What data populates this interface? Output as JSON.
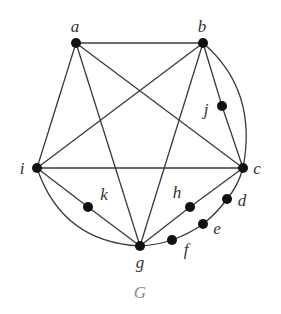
{
  "caption": "G",
  "colors": {
    "edge": "#3a3a3a",
    "vertex": "#111111",
    "label": "#333333",
    "caption": "#8a8a8a"
  },
  "vertices": [
    {
      "id": "a",
      "label": "a",
      "x": 76,
      "y": 43,
      "lx": 75,
      "ly": 32
    },
    {
      "id": "b",
      "label": "b",
      "x": 203,
      "y": 43,
      "lx": 202,
      "ly": 32
    },
    {
      "id": "j",
      "label": "j",
      "x": 222,
      "y": 106,
      "lx": 206,
      "ly": 115
    },
    {
      "id": "c",
      "label": "c",
      "x": 243,
      "y": 168,
      "lx": 257,
      "ly": 174
    },
    {
      "id": "d",
      "label": "d",
      "x": 227,
      "y": 199,
      "lx": 242,
      "ly": 206
    },
    {
      "id": "e",
      "label": "e",
      "x": 203,
      "y": 224,
      "lx": 217,
      "ly": 234
    },
    {
      "id": "f",
      "label": "f",
      "x": 172,
      "y": 240,
      "lx": 186,
      "ly": 255
    },
    {
      "id": "g",
      "label": "g",
      "x": 140,
      "y": 246,
      "lx": 140,
      "ly": 268
    },
    {
      "id": "h",
      "label": "h",
      "x": 190,
      "y": 207,
      "lx": 177,
      "ly": 198
    },
    {
      "id": "k",
      "label": "k",
      "x": 88,
      "y": 207,
      "lx": 104,
      "ly": 200
    },
    {
      "id": "i",
      "label": "i",
      "x": 37,
      "y": 168,
      "lx": 22,
      "ly": 174
    }
  ],
  "edges": [
    {
      "from": "a",
      "to": "b"
    },
    {
      "from": "a",
      "to": "i"
    },
    {
      "from": "a",
      "to": "g"
    },
    {
      "from": "a",
      "to": "c"
    },
    {
      "from": "b",
      "to": "i"
    },
    {
      "from": "b",
      "to": "g"
    },
    {
      "from": "b",
      "to": "j"
    },
    {
      "from": "j",
      "to": "c"
    },
    {
      "from": "b",
      "to": "c",
      "curve": true
    },
    {
      "from": "i",
      "to": "c"
    },
    {
      "from": "i",
      "to": "k"
    },
    {
      "from": "k",
      "to": "g"
    },
    {
      "from": "i",
      "to": "g",
      "curve": true
    },
    {
      "from": "g",
      "to": "h"
    },
    {
      "from": "h",
      "to": "c"
    },
    {
      "from": "g",
      "to": "f",
      "curve": true
    },
    {
      "from": "f",
      "to": "e",
      "curve": true
    },
    {
      "from": "e",
      "to": "d",
      "curve": true
    },
    {
      "from": "d",
      "to": "c",
      "curve": true
    }
  ]
}
